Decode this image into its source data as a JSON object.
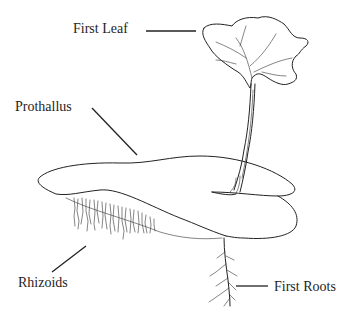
{
  "diagram": {
    "labels": {
      "first_leaf": "First Leaf",
      "prothallus": "Prothallus",
      "rhizoids": "Rhizoids",
      "first_roots": "First Roots"
    },
    "colors": {
      "background": "#ffffff",
      "ink": "#222222"
    }
  }
}
